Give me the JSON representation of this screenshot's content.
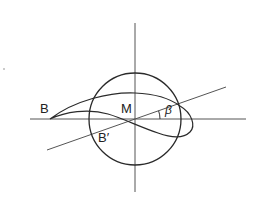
{
  "diagram": {
    "labels": {
      "point_b": "B",
      "point_b_prime": "B′",
      "center_m": "M",
      "angle_beta": "β"
    },
    "geometry": {
      "circle": {
        "cx": 135,
        "cy": 119,
        "r": 46
      },
      "horizontal_axis": {
        "x1": 30,
        "y1": 119,
        "x2": 246,
        "y2": 119
      },
      "vertical_axis": {
        "x1": 135,
        "y1": 23,
        "x2": 135,
        "y2": 192
      },
      "inclined_line": {
        "x1": 47,
        "y1": 150,
        "x2": 226,
        "y2": 87
      }
    },
    "colors": {
      "stroke": "#2a2a2a",
      "axis_stroke": "#555555",
      "background": "#ffffff"
    }
  }
}
